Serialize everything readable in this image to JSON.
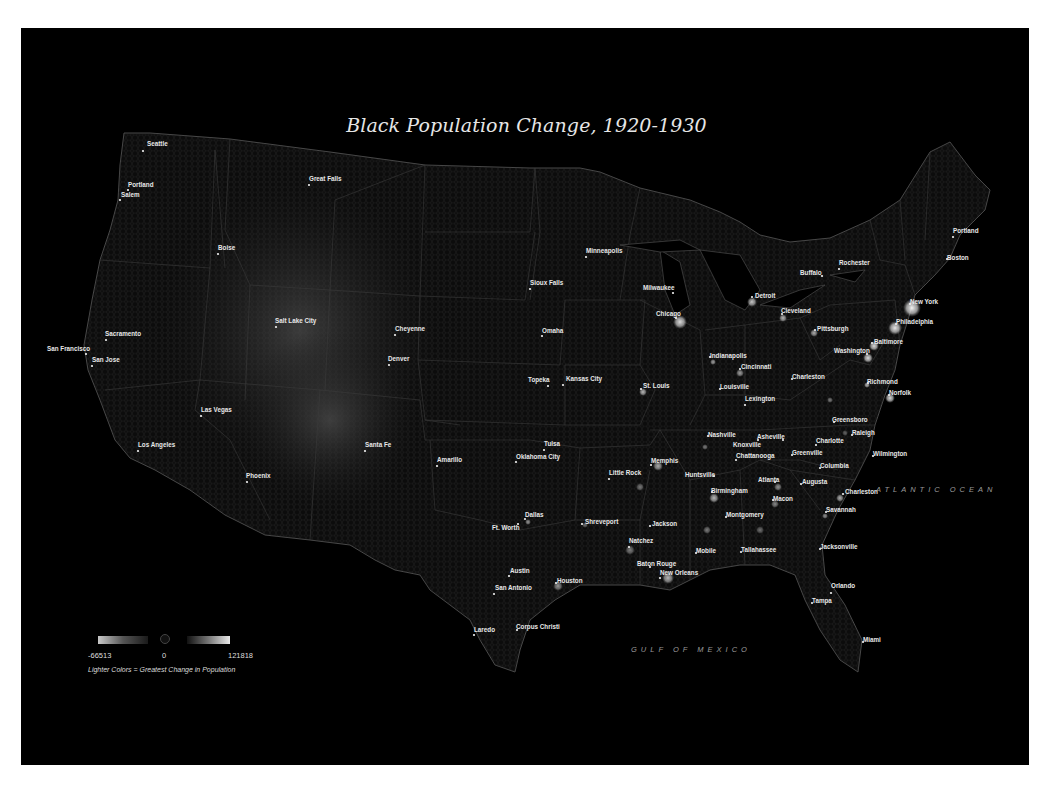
{
  "map": {
    "title": "Black Population Change, 1920-1930",
    "oceans": [
      {
        "name": "ATLANTIC OCEAN",
        "x": 876,
        "y": 492
      },
      {
        "name": "GULF OF MEXICO",
        "x": 631,
        "y": 652
      }
    ],
    "cities": [
      {
        "name": "Seattle",
        "x": 143,
        "y": 151,
        "lx": 147,
        "ly": 146
      },
      {
        "name": "Portland",
        "x": 128,
        "y": 190,
        "lx": 128,
        "ly": 187
      },
      {
        "name": "Salem",
        "x": 120,
        "y": 200,
        "lx": 121,
        "ly": 197
      },
      {
        "name": "Great Falls",
        "x": 309,
        "y": 185,
        "lx": 309,
        "ly": 181
      },
      {
        "name": "Boise",
        "x": 218,
        "y": 254,
        "lx": 218,
        "ly": 250
      },
      {
        "name": "Sacramento",
        "x": 106,
        "y": 340,
        "lx": 105,
        "ly": 336
      },
      {
        "name": "San Francisco",
        "x": 86,
        "y": 354,
        "lx": 47,
        "ly": 351
      },
      {
        "name": "San Jose",
        "x": 92,
        "y": 366,
        "lx": 92,
        "ly": 362
      },
      {
        "name": "Salt Lake City",
        "x": 276,
        "y": 327,
        "lx": 275,
        "ly": 323
      },
      {
        "name": "Cheyenne",
        "x": 395,
        "y": 335,
        "lx": 395,
        "ly": 331
      },
      {
        "name": "Denver",
        "x": 389,
        "y": 365,
        "lx": 388,
        "ly": 361
      },
      {
        "name": "Las Vegas",
        "x": 201,
        "y": 416,
        "lx": 201,
        "ly": 412
      },
      {
        "name": "Los Angeles",
        "x": 138,
        "y": 451,
        "lx": 138,
        "ly": 447
      },
      {
        "name": "Phoenix",
        "x": 247,
        "y": 482,
        "lx": 246,
        "ly": 478
      },
      {
        "name": "Santa Fe",
        "x": 365,
        "y": 451,
        "lx": 365,
        "ly": 447
      },
      {
        "name": "Amarillo",
        "x": 437,
        "y": 466,
        "lx": 437,
        "ly": 462
      },
      {
        "name": "Minneapolis",
        "x": 586,
        "y": 257,
        "lx": 586,
        "ly": 253
      },
      {
        "name": "Sioux Falls",
        "x": 530,
        "y": 289,
        "lx": 530,
        "ly": 285
      },
      {
        "name": "Omaha",
        "x": 542,
        "y": 336,
        "lx": 542,
        "ly": 333
      },
      {
        "name": "Topeka",
        "x": 548,
        "y": 386,
        "lx": 528,
        "ly": 382
      },
      {
        "name": "Kansas City",
        "x": 563,
        "y": 385,
        "lx": 566,
        "ly": 381
      },
      {
        "name": "Tulsa",
        "x": 544,
        "y": 450,
        "lx": 544,
        "ly": 446
      },
      {
        "name": "Oklahoma City",
        "x": 516,
        "y": 462,
        "lx": 516,
        "ly": 459
      },
      {
        "name": "Milwaukee",
        "x": 673,
        "y": 293,
        "lx": 643,
        "ly": 290
      },
      {
        "name": "Chicago",
        "x": 676,
        "y": 318,
        "lx": 656,
        "ly": 316
      },
      {
        "name": "St. Louis",
        "x": 641,
        "y": 389,
        "lx": 643,
        "ly": 388
      },
      {
        "name": "Little Rock",
        "x": 609,
        "y": 479,
        "lx": 609,
        "ly": 475
      },
      {
        "name": "Memphis",
        "x": 651,
        "y": 465,
        "lx": 651,
        "ly": 463
      },
      {
        "name": "Dallas",
        "x": 525,
        "y": 519,
        "lx": 525,
        "ly": 517
      },
      {
        "name": "Ft. Worth",
        "x": 518,
        "y": 524,
        "lx": 492,
        "ly": 530
      },
      {
        "name": "Shreveport",
        "x": 582,
        "y": 524,
        "lx": 585,
        "ly": 524
      },
      {
        "name": "Jackson",
        "x": 650,
        "y": 526,
        "lx": 652,
        "ly": 526
      },
      {
        "name": "Natchez",
        "x": 629,
        "y": 547,
        "lx": 629,
        "ly": 543
      },
      {
        "name": "Baton Rouge",
        "x": 650,
        "y": 567,
        "lx": 637,
        "ly": 566
      },
      {
        "name": "New Orleans",
        "x": 660,
        "y": 578,
        "lx": 660,
        "ly": 575
      },
      {
        "name": "Austin",
        "x": 509,
        "y": 576,
        "lx": 510,
        "ly": 573
      },
      {
        "name": "San Antonio",
        "x": 494,
        "y": 594,
        "lx": 495,
        "ly": 590
      },
      {
        "name": "Houston",
        "x": 556,
        "y": 583,
        "lx": 557,
        "ly": 583
      },
      {
        "name": "Corpus Christi",
        "x": 517,
        "y": 630,
        "lx": 516,
        "ly": 629
      },
      {
        "name": "Laredo",
        "x": 474,
        "y": 635,
        "lx": 474,
        "ly": 632
      },
      {
        "name": "Detroit",
        "x": 752,
        "y": 297,
        "lx": 755,
        "ly": 298
      },
      {
        "name": "Cleveland",
        "x": 782,
        "y": 314,
        "lx": 781,
        "ly": 313
      },
      {
        "name": "Pittsburgh",
        "x": 815,
        "y": 330,
        "lx": 817,
        "ly": 331
      },
      {
        "name": "Indianapolis",
        "x": 710,
        "y": 357,
        "lx": 710,
        "ly": 358
      },
      {
        "name": "Cincinnati",
        "x": 740,
        "y": 369,
        "lx": 741,
        "ly": 369
      },
      {
        "name": "Louisville",
        "x": 720,
        "y": 389,
        "lx": 720,
        "ly": 389
      },
      {
        "name": "Lexington",
        "x": 745,
        "y": 405,
        "lx": 745,
        "ly": 401
      },
      {
        "name": "Charleston",
        "x": 792,
        "y": 379,
        "lx": 792,
        "ly": 379
      },
      {
        "name": "Buffalo",
        "x": 822,
        "y": 276,
        "lx": 800,
        "ly": 275
      },
      {
        "name": "Rochester",
        "x": 839,
        "y": 269,
        "lx": 839,
        "ly": 265
      },
      {
        "name": "Portland",
        "x": 953,
        "y": 237,
        "lx": 953,
        "ly": 233
      },
      {
        "name": "Boston",
        "x": 947,
        "y": 259,
        "lx": 947,
        "ly": 260
      },
      {
        "name": "New York",
        "x": 910,
        "y": 304,
        "lx": 910,
        "ly": 304
      },
      {
        "name": "Philadelphia",
        "x": 896,
        "y": 324,
        "lx": 896,
        "ly": 324
      },
      {
        "name": "Baltimore",
        "x": 872,
        "y": 343,
        "lx": 874,
        "ly": 344
      },
      {
        "name": "Washington",
        "x": 867,
        "y": 354,
        "lx": 834,
        "ly": 353
      },
      {
        "name": "Richmond",
        "x": 868,
        "y": 383,
        "lx": 867,
        "ly": 384
      },
      {
        "name": "Norfolk",
        "x": 889,
        "y": 395,
        "lx": 889,
        "ly": 395
      },
      {
        "name": "Greensboro",
        "x": 834,
        "y": 422,
        "lx": 832,
        "ly": 422
      },
      {
        "name": "Raleigh",
        "x": 852,
        "y": 435,
        "lx": 852,
        "ly": 435
      },
      {
        "name": "Nashville",
        "x": 708,
        "y": 436,
        "lx": 708,
        "ly": 437
      },
      {
        "name": "Knoxville",
        "x": 758,
        "y": 440,
        "lx": 733,
        "ly": 447
      },
      {
        "name": "Asheville",
        "x": 783,
        "y": 440,
        "lx": 757,
        "ly": 439
      },
      {
        "name": "Charlotte",
        "x": 816,
        "y": 445,
        "lx": 816,
        "ly": 443
      },
      {
        "name": "Chattanooga",
        "x": 736,
        "y": 460,
        "lx": 736,
        "ly": 458
      },
      {
        "name": "Greenville",
        "x": 792,
        "y": 455,
        "lx": 792,
        "ly": 455
      },
      {
        "name": "Wilmington",
        "x": 873,
        "y": 456,
        "lx": 873,
        "ly": 456
      },
      {
        "name": "Columbia",
        "x": 820,
        "y": 468,
        "lx": 820,
        "ly": 468
      },
      {
        "name": "Huntsville",
        "x": 714,
        "y": 476,
        "lx": 685,
        "ly": 477
      },
      {
        "name": "Atlanta",
        "x": 775,
        "y": 482,
        "lx": 758,
        "ly": 482
      },
      {
        "name": "Augusta",
        "x": 801,
        "y": 484,
        "lx": 802,
        "ly": 484
      },
      {
        "name": "Birmingham",
        "x": 712,
        "y": 492,
        "lx": 711,
        "ly": 493
      },
      {
        "name": "Macon",
        "x": 773,
        "y": 500,
        "lx": 773,
        "ly": 501
      },
      {
        "name": "Charleston",
        "x": 843,
        "y": 494,
        "lx": 845,
        "ly": 494
      },
      {
        "name": "Savannah",
        "x": 826,
        "y": 512,
        "lx": 826,
        "ly": 512
      },
      {
        "name": "Montgomery",
        "x": 726,
        "y": 517,
        "lx": 726,
        "ly": 517
      },
      {
        "name": "Mobile",
        "x": 696,
        "y": 553,
        "lx": 696,
        "ly": 553
      },
      {
        "name": "Tallahassee",
        "x": 741,
        "y": 552,
        "lx": 741,
        "ly": 552
      },
      {
        "name": "Jacksonville",
        "x": 820,
        "y": 549,
        "lx": 820,
        "ly": 549
      },
      {
        "name": "Orlando",
        "x": 831,
        "y": 593,
        "lx": 831,
        "ly": 588
      },
      {
        "name": "Tampa",
        "x": 812,
        "y": 603,
        "lx": 812,
        "ly": 603
      },
      {
        "name": "Miami",
        "x": 863,
        "y": 642,
        "lx": 863,
        "ly": 642
      }
    ],
    "hotspots": [
      {
        "x": 912,
        "y": 308,
        "r": 9,
        "o": 0.95
      },
      {
        "x": 895,
        "y": 328,
        "r": 7,
        "o": 0.9
      },
      {
        "x": 874,
        "y": 346,
        "r": 5,
        "o": 0.85
      },
      {
        "x": 868,
        "y": 358,
        "r": 5,
        "o": 0.85
      },
      {
        "x": 890,
        "y": 398,
        "r": 5,
        "o": 0.85
      },
      {
        "x": 867,
        "y": 385,
        "r": 3,
        "o": 0.7
      },
      {
        "x": 680,
        "y": 322,
        "r": 7,
        "o": 0.85
      },
      {
        "x": 752,
        "y": 302,
        "r": 5,
        "o": 0.75
      },
      {
        "x": 783,
        "y": 318,
        "r": 4,
        "o": 0.7
      },
      {
        "x": 814,
        "y": 333,
        "r": 4,
        "o": 0.65
      },
      {
        "x": 643,
        "y": 392,
        "r": 4,
        "o": 0.7
      },
      {
        "x": 713,
        "y": 362,
        "r": 3,
        "o": 0.6
      },
      {
        "x": 740,
        "y": 373,
        "r": 4,
        "o": 0.6
      },
      {
        "x": 658,
        "y": 466,
        "r": 5,
        "o": 0.65
      },
      {
        "x": 714,
        "y": 498,
        "r": 5,
        "o": 0.7
      },
      {
        "x": 668,
        "y": 578,
        "r": 6,
        "o": 0.7
      },
      {
        "x": 558,
        "y": 586,
        "r": 5,
        "o": 0.55
      },
      {
        "x": 528,
        "y": 522,
        "r": 3,
        "o": 0.55
      },
      {
        "x": 840,
        "y": 498,
        "r": 4,
        "o": 0.65
      },
      {
        "x": 825,
        "y": 516,
        "r": 3,
        "o": 0.55
      },
      {
        "x": 778,
        "y": 487,
        "r": 4,
        "o": 0.55
      },
      {
        "x": 775,
        "y": 504,
        "r": 4,
        "o": 0.5
      },
      {
        "x": 640,
        "y": 487,
        "r": 4,
        "o": 0.45
      },
      {
        "x": 705,
        "y": 447,
        "r": 3,
        "o": 0.45
      },
      {
        "x": 630,
        "y": 550,
        "r": 5,
        "o": 0.45
      },
      {
        "x": 585,
        "y": 525,
        "r": 3,
        "o": 0.4
      },
      {
        "x": 707,
        "y": 530,
        "r": 4,
        "o": 0.45
      },
      {
        "x": 760,
        "y": 530,
        "r": 4,
        "o": 0.4
      },
      {
        "x": 830,
        "y": 400,
        "r": 3,
        "o": 0.45
      },
      {
        "x": 845,
        "y": 433,
        "r": 3,
        "o": 0.35
      }
    ]
  },
  "legend": {
    "min": "-66513",
    "zero": "0",
    "max": "121818",
    "note": "Lighter Colors = Greatest Change in Population"
  }
}
